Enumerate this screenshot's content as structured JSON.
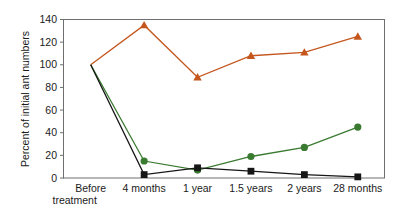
{
  "chart_data": {
    "type": "line",
    "title": "",
    "xlabel": "",
    "ylabel": "Percent of initial ant numbers",
    "categories": [
      "Before\ntreatment",
      "4 months",
      "1 year",
      "1.5 years",
      "2 years",
      "28 months"
    ],
    "category_labels": [
      {
        "line1": "Before",
        "line2": "treatment"
      },
      {
        "line1": "4 months",
        "line2": ""
      },
      {
        "line1": "1 year",
        "line2": ""
      },
      {
        "line1": "1.5 years",
        "line2": ""
      },
      {
        "line1": "2 years",
        "line2": ""
      },
      {
        "line1": "28 months",
        "line2": ""
      }
    ],
    "ylim": [
      0,
      140
    ],
    "yticks": [
      0,
      20,
      40,
      60,
      80,
      100,
      120,
      140
    ],
    "ytick_labels": [
      "0",
      "20",
      "40",
      "60",
      "80",
      "100",
      "120",
      "140"
    ],
    "grid": false,
    "legend": "none",
    "series": [
      {
        "name": "orange-triangles",
        "color": "#C4561E",
        "marker": "triangle",
        "values": [
          100,
          135,
          89,
          108,
          111,
          125
        ]
      },
      {
        "name": "green-circles",
        "color": "#3B7A31",
        "marker": "circle",
        "values": [
          100,
          15,
          7,
          19,
          27,
          45
        ]
      },
      {
        "name": "black-squares",
        "color": "#161616",
        "marker": "square",
        "values": [
          100,
          3,
          9,
          6,
          3,
          1
        ]
      }
    ]
  },
  "axes": {
    "frame_color": "#6f6f6f",
    "background": "#ffffff"
  }
}
